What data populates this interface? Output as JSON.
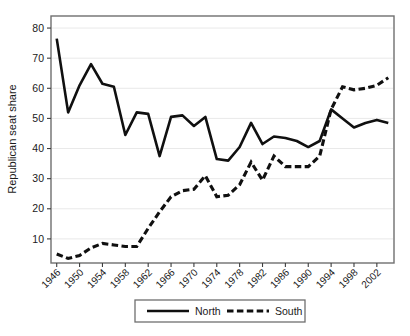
{
  "chart_data": {
    "type": "line",
    "title": "",
    "subtitle": "",
    "xlabel": "",
    "ylabel": "Republican seat share",
    "xlim": [
      1945,
      2005
    ],
    "ylim": [
      2,
      84
    ],
    "grid": true,
    "grid_axis": "y",
    "legend_position": "bottom-center",
    "x_tick_labels": [
      "1946",
      "1950",
      "1954",
      "1958",
      "1962",
      "1966",
      "1970",
      "1974",
      "1978",
      "1982",
      "1986",
      "1990",
      "1994",
      "1998",
      "2002"
    ],
    "y_tick_labels": [
      "10",
      "20",
      "30",
      "40",
      "50",
      "60",
      "70",
      "80"
    ],
    "y_ticks": [
      10,
      20,
      30,
      40,
      50,
      60,
      70,
      80
    ],
    "x": [
      1946,
      1948,
      1950,
      1952,
      1954,
      1956,
      1958,
      1960,
      1962,
      1964,
      1966,
      1968,
      1970,
      1972,
      1974,
      1976,
      1978,
      1980,
      1982,
      1984,
      1986,
      1988,
      1990,
      1992,
      1994,
      1996,
      1998,
      2000,
      2002,
      2004
    ],
    "series": [
      {
        "name": "North",
        "style": "solid",
        "color": "#101010",
        "values": [
          76.5,
          52.0,
          61.0,
          68.0,
          61.5,
          60.5,
          44.5,
          52.0,
          51.5,
          37.5,
          50.5,
          51.0,
          47.5,
          50.5,
          36.5,
          36.0,
          40.5,
          48.5,
          41.5,
          44.0,
          43.5,
          42.5,
          40.5,
          42.5,
          53.0,
          50.0,
          47.0,
          48.5,
          49.5,
          48.5
        ]
      },
      {
        "name": "South",
        "style": "dashed",
        "color": "#101010",
        "values": [
          5.0,
          3.5,
          4.5,
          7.0,
          8.5,
          8.0,
          7.5,
          7.5,
          13.5,
          19.0,
          24.0,
          26.0,
          26.5,
          31.0,
          24.0,
          24.5,
          28.0,
          35.5,
          29.5,
          37.5,
          34.0,
          34.0,
          34.0,
          37.5,
          53.0,
          60.5,
          59.5,
          60.0,
          61.0,
          63.5
        ]
      }
    ]
  },
  "legend": {
    "entries": [
      {
        "label": "North",
        "style": "solid"
      },
      {
        "label": "South",
        "style": "dashed"
      }
    ]
  }
}
